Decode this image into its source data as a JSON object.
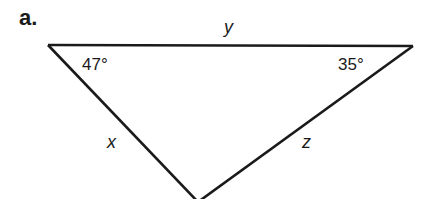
{
  "problem": {
    "part_label": "a.",
    "triangle": {
      "vertices": {
        "top_left": [
          48,
          45
        ],
        "top_right": [
          413,
          46
        ],
        "bottom": [
          198,
          202
        ]
      },
      "angles": [
        {
          "vertex": "top_left",
          "label": "47°"
        },
        {
          "vertex": "top_right",
          "label": "35°"
        }
      ],
      "sides": [
        {
          "name": "top",
          "label": "y"
        },
        {
          "name": "left",
          "label": "x"
        },
        {
          "name": "right",
          "label": "z"
        }
      ],
      "stroke_color": "#1a1a1a"
    }
  }
}
